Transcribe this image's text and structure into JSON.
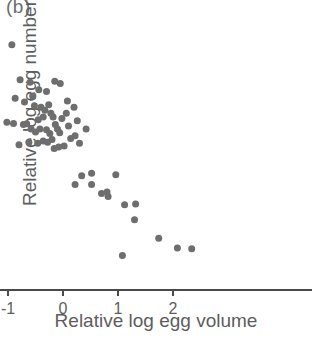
{
  "panel": {
    "label": "(b)"
  },
  "chart_data": {
    "type": "scatter",
    "title": "",
    "panel_label": "(b)",
    "xlabel": "Relative log egg volume",
    "ylabel": "Relative log egg number",
    "xlim": [
      -2,
      2.6
    ],
    "ylim": [
      -4,
      3
    ],
    "xticks": [
      -2,
      -1,
      0,
      1,
      2
    ],
    "xticklabels": [
      "-2",
      "-1",
      "0",
      "1",
      "2"
    ],
    "yticks": [
      -4,
      -3,
      -2,
      -1,
      0,
      1,
      2,
      3
    ],
    "yticklabels": [
      "-4",
      "-3",
      "-2",
      "-1",
      "0",
      "1",
      "2",
      "3"
    ],
    "grid": false,
    "legend": null,
    "marker": {
      "shape": "circle",
      "color": "#6e6e6e",
      "size": 7
    },
    "series": [
      {
        "name": "eggs",
        "points": [
          [
            -0.93,
            2.55
          ],
          [
            -0.78,
            1.62
          ],
          [
            -0.6,
            1.55
          ],
          [
            -0.87,
            1.12
          ],
          [
            -0.7,
            1.02
          ],
          [
            -0.44,
            1.35
          ],
          [
            -0.3,
            1.3
          ],
          [
            -0.15,
            1.58
          ],
          [
            -0.05,
            1.52
          ],
          [
            -0.52,
            0.92
          ],
          [
            -0.4,
            0.88
          ],
          [
            -0.33,
            0.8
          ],
          [
            -0.26,
            0.95
          ],
          [
            -0.22,
            0.72
          ],
          [
            -0.18,
            0.62
          ],
          [
            -0.36,
            0.62
          ],
          [
            -0.45,
            0.55
          ],
          [
            -1.02,
            0.48
          ],
          [
            -0.9,
            0.45
          ],
          [
            -0.72,
            0.42
          ],
          [
            -0.66,
            0.44
          ],
          [
            -0.58,
            0.3
          ],
          [
            -0.5,
            0.22
          ],
          [
            -0.42,
            0.3
          ],
          [
            -0.3,
            0.28
          ],
          [
            -0.24,
            0.18
          ],
          [
            -0.14,
            0.42
          ],
          [
            -0.1,
            0.3
          ],
          [
            -0.06,
            0.2
          ],
          [
            -0.02,
            0.58
          ],
          [
            0.06,
            0.72
          ],
          [
            0.1,
            0.38
          ],
          [
            0.14,
            0.05
          ],
          [
            -0.2,
            0.02
          ],
          [
            -0.28,
            -0.05
          ],
          [
            -0.36,
            -0.02
          ],
          [
            -0.46,
            -0.08
          ],
          [
            -0.62,
            -0.05
          ],
          [
            -0.8,
            -0.12
          ],
          [
            0.22,
            0.12
          ],
          [
            0.3,
            -0.08
          ],
          [
            0.02,
            -0.15
          ],
          [
            -0.08,
            -0.18
          ],
          [
            -0.16,
            -0.22
          ],
          [
            0.42,
            0.3
          ],
          [
            0.26,
            0.52
          ],
          [
            0.08,
            1.05
          ],
          [
            0.2,
            0.88
          ],
          [
            -0.55,
            1.18
          ],
          [
            0.34,
            -0.95
          ],
          [
            0.52,
            -0.88
          ],
          [
            0.52,
            -1.18
          ],
          [
            0.7,
            -1.42
          ],
          [
            0.8,
            -1.38
          ],
          [
            0.82,
            -1.5
          ],
          [
            0.96,
            -0.92
          ],
          [
            1.12,
            -1.72
          ],
          [
            1.32,
            -1.7
          ],
          [
            1.3,
            -2.12
          ],
          [
            1.08,
            -3.08
          ],
          [
            1.74,
            -2.62
          ],
          [
            2.08,
            -2.88
          ],
          [
            2.34,
            -2.9
          ],
          [
            0.22,
            -1.18
          ]
        ]
      }
    ]
  },
  "axes": {
    "geometry": {
      "x0_px": 63,
      "y0_px": 290,
      "x_unit_px": 55,
      "y_unit_px": 37.43,
      "x_axis_end_px": 312,
      "y_axis_top_px": 28
    }
  }
}
